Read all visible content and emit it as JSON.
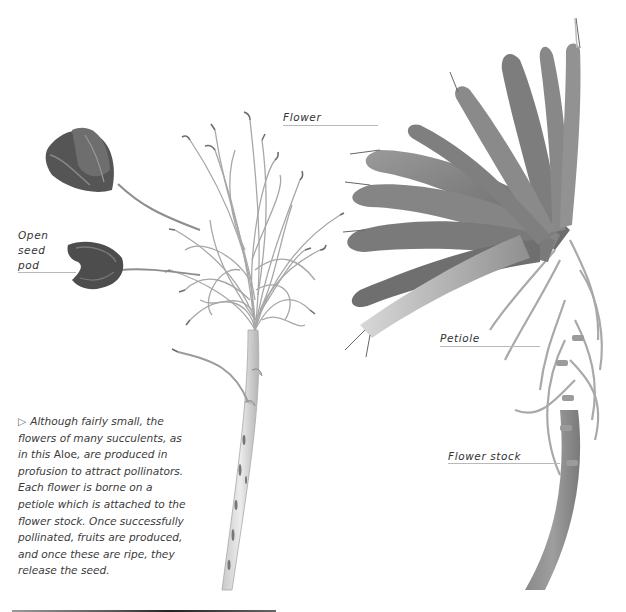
{
  "labels": {
    "flower": "Flower",
    "open_seed_pod_line1": "Open",
    "open_seed_pod_line2": "seed",
    "open_seed_pod_line3": "pod",
    "petiole": "Petiole",
    "flower_stock": "Flower stock"
  },
  "caption": {
    "marker": "▷",
    "text_before": "Although fairly small, the flowers of many succulents, as in this ",
    "plant_name": "Aloe",
    "text_after": ", are produced in profusion to attract pollinators. Each flower is borne on a petiole which is attached to the flower stock. Once successfully pollinated, fruits are produced, and once these are ripe, they release the seed."
  },
  "images": {
    "left": "dried-aloe-inflorescence-with-open-seed-pods",
    "right": "aloe-flower-cluster-on-stalk"
  },
  "colors": {
    "text": "#333333",
    "leader_line": "#b9b9b9",
    "background": "#ffffff"
  }
}
